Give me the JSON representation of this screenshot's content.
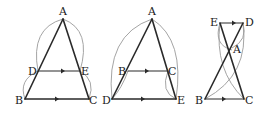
{
  "figures": [
    {
      "id": "figure-1",
      "labels": {
        "A": "A",
        "B": "B",
        "C": "C",
        "D": "D",
        "E": "E"
      },
      "description": "Triangle ABC with DE parallel to BC, D on AB, E on AC"
    },
    {
      "id": "figure-2",
      "labels": {
        "A": "A",
        "B": "B",
        "C": "C",
        "D": "D",
        "E": "E"
      },
      "description": "Triangle ADE with BC parallel to DE, B on AD, C on AE"
    },
    {
      "id": "figure-3",
      "labels": {
        "A": "A",
        "B": "B",
        "C": "C",
        "D": "D",
        "E": "E"
      },
      "description": "ED parallel to BC with lines EC and DB intersecting at A"
    }
  ],
  "colors": {
    "edge": "#2a2a2a",
    "arc": "#9a9a9a",
    "background": "#ffffff"
  }
}
